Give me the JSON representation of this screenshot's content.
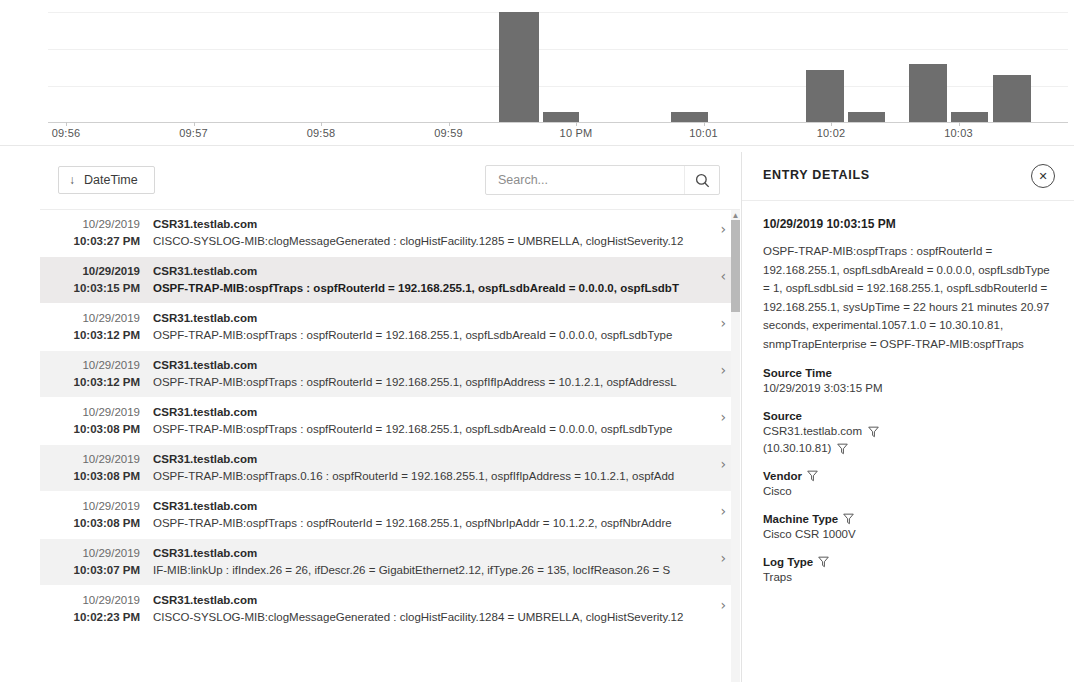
{
  "chart_data": {
    "type": "bar",
    "title": "",
    "xlabel": "",
    "ylabel": "",
    "grid": true,
    "legend": null,
    "categories": [
      "09:56",
      "09:57",
      "09:58",
      "09:59",
      "10 PM",
      "10:01",
      "10:02",
      "10:03"
    ],
    "tick_labels": [
      "09:56",
      "09:57",
      "09:58",
      "09:59",
      "10 PM",
      "10:01",
      "10:02",
      "10:03"
    ],
    "bars": [
      {
        "label": "10 PM bucket 1",
        "x_px": 499,
        "width_px": 40,
        "value": 100
      },
      {
        "label": "10 PM bucket 2",
        "x_px": 543,
        "width_px": 36,
        "value": 9
      },
      {
        "label": "10:01 bucket",
        "x_px": 671,
        "width_px": 37,
        "value": 9
      },
      {
        "label": "10:02 bucket 1",
        "x_px": 806,
        "width_px": 38,
        "value": 47
      },
      {
        "label": "10:02 bucket 2",
        "x_px": 848,
        "width_px": 37,
        "value": 9
      },
      {
        "label": "10:03 bucket 1",
        "x_px": 909,
        "width_px": 38,
        "value": 53
      },
      {
        "label": "10:03 bucket 2",
        "x_px": 951,
        "width_px": 37,
        "value": 9
      },
      {
        "label": "10:03 bucket 3",
        "x_px": 993,
        "width_px": 38,
        "value": 43
      }
    ],
    "ylim": [
      0,
      100
    ],
    "bar_color": "#6e6e6e"
  },
  "toolbar": {
    "sort_button_label": "DateTime",
    "sort_arrow": "↓",
    "search_placeholder": "Search...",
    "search_value": "",
    "search_icon": "search-icon"
  },
  "entries": [
    {
      "date": "10/29/2019",
      "time": "10:03:27 PM",
      "host": "CSR31.testlab.com",
      "message": "CISCO-SYSLOG-MIB:clogMessageGenerated : clogHistFacility.1285 = UMBRELLA, clogHistSeverity.12",
      "chevron": "›",
      "selected": false
    },
    {
      "date": "10/29/2019",
      "time": "10:03:15 PM",
      "host": "CSR31.testlab.com",
      "message": "OSPF-TRAP-MIB:ospfTraps : ospfRouterId = 192.168.255.1, ospfLsdbAreaId = 0.0.0.0, ospfLsdbT",
      "chevron": "‹",
      "selected": true
    },
    {
      "date": "10/29/2019",
      "time": "10:03:12 PM",
      "host": "CSR31.testlab.com",
      "message": "OSPF-TRAP-MIB:ospfTraps : ospfRouterId = 192.168.255.1, ospfLsdbAreaId = 0.0.0.0, ospfLsdbType",
      "chevron": "›",
      "selected": false
    },
    {
      "date": "10/29/2019",
      "time": "10:03:12 PM",
      "host": "CSR31.testlab.com",
      "message": "OSPF-TRAP-MIB:ospfTraps : ospfRouterId = 192.168.255.1, ospfIfIpAddress = 10.1.2.1, ospfAddressL",
      "chevron": "›",
      "selected": false
    },
    {
      "date": "10/29/2019",
      "time": "10:03:08 PM",
      "host": "CSR31.testlab.com",
      "message": "OSPF-TRAP-MIB:ospfTraps : ospfRouterId = 192.168.255.1, ospfLsdbAreaId = 0.0.0.0, ospfLsdbType",
      "chevron": "›",
      "selected": false
    },
    {
      "date": "10/29/2019",
      "time": "10:03:08 PM",
      "host": "CSR31.testlab.com",
      "message": "OSPF-TRAP-MIB:ospfTraps.0.16 : ospfRouterId = 192.168.255.1, ospfIfIpAddress = 10.1.2.1, ospfAdd",
      "chevron": "›",
      "selected": false
    },
    {
      "date": "10/29/2019",
      "time": "10:03:08 PM",
      "host": "CSR31.testlab.com",
      "message": "OSPF-TRAP-MIB:ospfTraps : ospfRouterId = 192.168.255.1, ospfNbrIpAddr = 10.1.2.2, ospfNbrAddre",
      "chevron": "›",
      "selected": false
    },
    {
      "date": "10/29/2019",
      "time": "10:03:07 PM",
      "host": "CSR31.testlab.com",
      "message": "IF-MIB:linkUp : ifIndex.26 = 26, ifDescr.26 = GigabitEthernet2.12, ifType.26 = 135, locIfReason.26 = S",
      "chevron": "›",
      "selected": false
    },
    {
      "date": "10/29/2019",
      "time": "10:02:23 PM",
      "host": "CSR31.testlab.com",
      "message": "CISCO-SYSLOG-MIB:clogMessageGenerated : clogHistFacility.1284 = UMBRELLA, clogHistSeverity.12",
      "chevron": "›",
      "selected": false
    }
  ],
  "details": {
    "title": "ENTRY DETAILS",
    "close_icon": "✕",
    "timestamp": "10/29/2019 10:03:15 PM",
    "description": "OSPF-TRAP-MIB:ospfTraps : ospfRouterId = 192.168.255.1, ospfLsdbAreaId = 0.0.0.0, ospfLsdbType = 1, ospfLsdbLsid = 192.168.255.1, ospfLsdbRouterId = 192.168.255.1, sysUpTime = 22 hours 21 minutes 20.97 seconds, experimental.1057.1.0 = 10.30.10.81, snmpTrapEnterprise = OSPF-TRAP-MIB:ospfTraps",
    "fields": [
      {
        "label": "Source Time",
        "label_has_filter": false,
        "values": [
          {
            "text": "10/29/2019 3:03:15 PM",
            "has_filter": false
          }
        ]
      },
      {
        "label": "Source",
        "label_has_filter": false,
        "values": [
          {
            "text": "CSR31.testlab.com",
            "has_filter": true
          },
          {
            "text": "(10.30.10.81)",
            "has_filter": true
          }
        ]
      },
      {
        "label": "Vendor",
        "label_has_filter": true,
        "values": [
          {
            "text": "Cisco",
            "has_filter": false
          }
        ]
      },
      {
        "label": "Machine Type",
        "label_has_filter": true,
        "values": [
          {
            "text": "Cisco CSR 1000V",
            "has_filter": false
          }
        ]
      },
      {
        "label": "Log Type",
        "label_has_filter": true,
        "values": [
          {
            "text": "Traps",
            "has_filter": false
          }
        ]
      }
    ]
  }
}
